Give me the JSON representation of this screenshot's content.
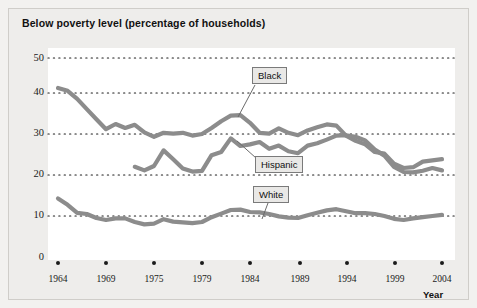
{
  "figure": {
    "title": "Below poverty level (percentage of households)",
    "y_axis_ticks": [
      "50",
      "40",
      "30",
      "20",
      "10",
      "0"
    ],
    "x_axis_ticks": [
      "1964",
      "1969",
      "1975",
      "1979",
      "1984",
      "1989",
      "1994",
      "1999",
      "2004"
    ],
    "x_axis_name": "Year",
    "callouts": [
      {
        "name": "black",
        "label": "Black"
      },
      {
        "name": "hispanic",
        "label": "Hispanic"
      },
      {
        "name": "white",
        "label": "White"
      }
    ],
    "colors": {
      "line": "#8c8c8c",
      "grid": "#1a1a1a",
      "panel": "#ffffff",
      "frame": "#eeedeb",
      "text": "#111111"
    }
  },
  "chart_data": {
    "type": "line",
    "title": "Below poverty level (percentage of households)",
    "xlabel": "Year",
    "ylabel": "",
    "xlim": [
      1964,
      2004
    ],
    "ylim": [
      0,
      50
    ],
    "yticks": [
      0,
      10,
      20,
      30,
      40,
      50
    ],
    "xticks": [
      1964,
      1969,
      1975,
      1979,
      1984,
      1989,
      1994,
      1999,
      2004
    ],
    "grid": "horizontal-dotted",
    "legend": "inline-callouts",
    "series": [
      {
        "name": "Black",
        "x": [
          1964,
          1965,
          1966,
          1967,
          1968,
          1969,
          1970,
          1971,
          1972,
          1973,
          1974,
          1975,
          1976,
          1977,
          1978,
          1979,
          1980,
          1981,
          1982,
          1983,
          1984,
          1985,
          1986,
          1987,
          1988,
          1989,
          1990,
          1991,
          1992,
          1993,
          1994,
          1995,
          1996,
          1997,
          1998,
          1999,
          2000,
          2001,
          2002,
          2003,
          2004
        ],
        "values": [
          42.5,
          41.8,
          39.8,
          37.2,
          34.7,
          32.2,
          33.5,
          32.5,
          33.3,
          31.4,
          30.3,
          31.3,
          31.1,
          31.3,
          30.6,
          31.0,
          32.5,
          34.2,
          35.6,
          35.7,
          33.8,
          31.3,
          31.1,
          32.4,
          31.3,
          30.7,
          31.9,
          32.7,
          33.4,
          33.1,
          30.6,
          29.3,
          28.4,
          26.5,
          26.1,
          23.6,
          22.5,
          22.7,
          24.1,
          24.4,
          24.7
        ]
      },
      {
        "name": "Hispanic",
        "x": [
          1972,
          1973,
          1974,
          1975,
          1976,
          1977,
          1978,
          1979,
          1980,
          1981,
          1982,
          1983,
          1984,
          1985,
          1986,
          1987,
          1988,
          1989,
          1990,
          1991,
          1992,
          1993,
          1994,
          1995,
          1996,
          1997,
          1998,
          1999,
          2000,
          2001,
          2002,
          2003,
          2004
        ],
        "values": [
          22.8,
          21.9,
          23.0,
          26.9,
          24.7,
          22.4,
          21.6,
          21.8,
          25.7,
          26.5,
          29.9,
          28.0,
          28.4,
          29.0,
          27.3,
          28.1,
          26.7,
          26.2,
          28.1,
          28.7,
          29.6,
          30.6,
          30.7,
          30.3,
          29.4,
          27.1,
          25.6,
          22.8,
          21.5,
          21.4,
          21.8,
          22.5,
          21.9
        ]
      },
      {
        "name": "White",
        "x": [
          1964,
          1965,
          1966,
          1967,
          1968,
          1969,
          1970,
          1971,
          1972,
          1973,
          1974,
          1975,
          1976,
          1977,
          1978,
          1979,
          1980,
          1981,
          1982,
          1983,
          1984,
          1985,
          1986,
          1987,
          1988,
          1989,
          1990,
          1991,
          1992,
          1993,
          1994,
          1995,
          1996,
          1997,
          1998,
          1999,
          2000,
          2001,
          2002,
          2003,
          2004
        ],
        "values": [
          14.9,
          13.3,
          11.3,
          11.0,
          10.0,
          9.5,
          9.9,
          9.9,
          9.0,
          8.4,
          8.6,
          9.7,
          9.1,
          8.9,
          8.7,
          9.0,
          10.2,
          11.1,
          12.0,
          12.1,
          11.5,
          11.4,
          11.0,
          10.4,
          10.1,
          10.0,
          10.7,
          11.3,
          11.9,
          12.2,
          11.7,
          11.2,
          11.2,
          11.0,
          10.5,
          9.8,
          9.5,
          9.9,
          10.2,
          10.5,
          10.8
        ]
      }
    ],
    "annotations": [
      {
        "text": "Black",
        "x": 1984,
        "y": 45
      },
      {
        "text": "Hispanic",
        "x": 1985,
        "y": 28
      },
      {
        "text": "White",
        "x": 1985,
        "y": 16
      }
    ]
  }
}
